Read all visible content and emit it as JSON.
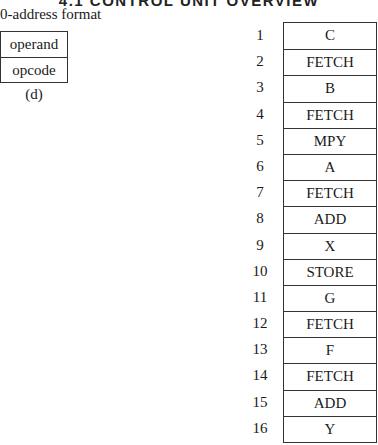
{
  "header": {
    "title": "4.1 CONTROL UNIT OVERVIEW"
  },
  "format": {
    "title": "0-address format",
    "fields": [
      "operand",
      "opcode"
    ],
    "caption": "(d)"
  },
  "program": {
    "rows": [
      {
        "num": "1",
        "instr": "C"
      },
      {
        "num": "2",
        "instr": "FETCH"
      },
      {
        "num": "3",
        "instr": "B"
      },
      {
        "num": "4",
        "instr": "FETCH"
      },
      {
        "num": "5",
        "instr": "MPY"
      },
      {
        "num": "6",
        "instr": "A"
      },
      {
        "num": "7",
        "instr": "FETCH"
      },
      {
        "num": "8",
        "instr": "ADD"
      },
      {
        "num": "9",
        "instr": "X"
      },
      {
        "num": "10",
        "instr": "STORE"
      },
      {
        "num": "11",
        "instr": "G"
      },
      {
        "num": "12",
        "instr": "FETCH"
      },
      {
        "num": "13",
        "instr": "F"
      },
      {
        "num": "14",
        "instr": "FETCH"
      },
      {
        "num": "15",
        "instr": "ADD"
      },
      {
        "num": "16",
        "instr": "Y"
      }
    ]
  }
}
